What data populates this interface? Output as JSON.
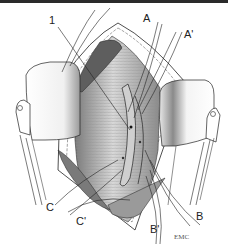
{
  "figure": {
    "labels": {
      "one": "1",
      "a": "A",
      "a_prime": "A'",
      "b": "B",
      "b_prime": "B'",
      "c": "C",
      "c_prime": "C'"
    },
    "signature": "EMC",
    "colors": {
      "line": "#222222",
      "muscle_dark": "#6e6e6e",
      "muscle_mid": "#a8a8a8",
      "muscle_light": "#d9d9d9",
      "retractor": "#f4f4f4",
      "fat": "#ffffff"
    }
  }
}
